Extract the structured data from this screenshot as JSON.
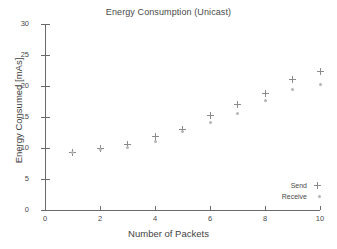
{
  "chart_data": {
    "type": "scatter",
    "title": "Energy Consumption (Unicast)",
    "xlabel": "Number of Packets",
    "ylabel": "Energy Consumed [mAs]",
    "xlim": [
      0,
      10
    ],
    "ylim": [
      0,
      30
    ],
    "xticks": [
      0,
      2,
      4,
      6,
      8,
      10
    ],
    "yticks": [
      0,
      5,
      10,
      15,
      20,
      25,
      30
    ],
    "grid": false,
    "legend_position": "bottom-right",
    "x": [
      1,
      2,
      3,
      4,
      5,
      6,
      7,
      8,
      9,
      10
    ],
    "series": [
      {
        "name": "Send",
        "marker": "plus",
        "color": "#8a8a8a",
        "values": [
          9.2,
          9.9,
          10.6,
          11.8,
          13.0,
          15.2,
          17.0,
          18.8,
          21.0,
          22.4
        ]
      },
      {
        "name": "Receive",
        "marker": "dot",
        "color": "#b4b4b4",
        "values": [
          9.2,
          9.7,
          10.1,
          11.1,
          12.7,
          14.1,
          15.6,
          17.6,
          19.5,
          20.3
        ]
      }
    ]
  }
}
